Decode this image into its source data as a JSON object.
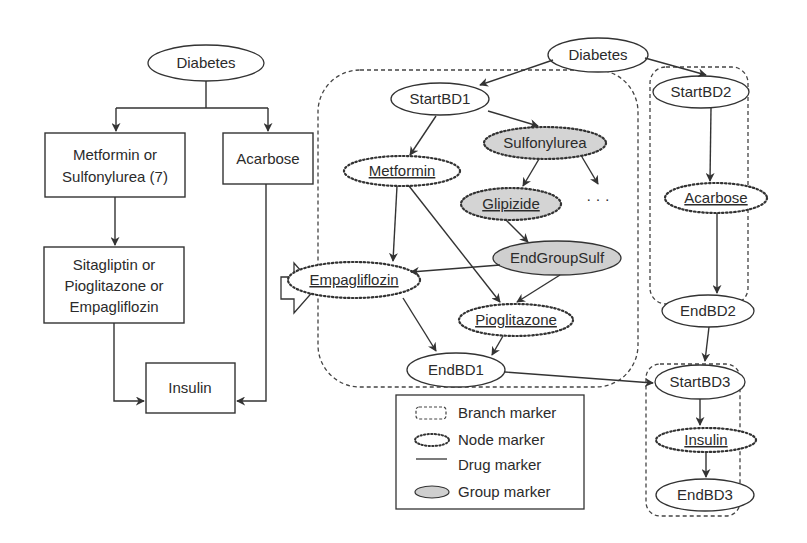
{
  "left_flowchart": {
    "root": "Diabetes",
    "step1_left_line1": "Metformin or",
    "step1_left_line2": "Sulfonylurea (7)",
    "step1_right": "Acarbose",
    "step2_line1": "Sitagliptin or",
    "step2_line2": "Pioglitazone or",
    "step2_line3": "Empagliflozin",
    "final": "Insulin"
  },
  "transform_arrow": "hollow-right-arrow",
  "right_graph": {
    "root": "Diabetes",
    "branch1": {
      "start": "StartBD1",
      "metformin": "Metformin",
      "sulfonylurea": "Sulfonylurea",
      "glipizide": "Glipizide",
      "ellipsis": "· · ·",
      "end_group": "EndGroupSulf",
      "empagliflozin": "Empagliflozin",
      "pioglitazone": "Pioglitazone",
      "end": "EndBD1"
    },
    "branch2": {
      "start": "StartBD2",
      "acarbose": "Acarbose",
      "end": "EndBD2"
    },
    "branch3": {
      "start": "StartBD3",
      "insulin": "Insulin",
      "end": "EndBD3"
    }
  },
  "legend": {
    "items": [
      {
        "icon": "branch-marker-icon",
        "label": "Branch marker"
      },
      {
        "icon": "node-marker-icon",
        "label": "Node marker"
      },
      {
        "icon": "drug-marker-icon",
        "label": "Drug marker"
      },
      {
        "icon": "group-marker-icon",
        "label": "Group marker"
      }
    ]
  },
  "colors": {
    "stroke": "#333333",
    "group_fill": "#d4d4d4",
    "background": "#ffffff"
  }
}
